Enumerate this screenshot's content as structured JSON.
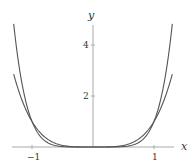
{
  "chart_data": {
    "type": "line",
    "title": "",
    "xlabel": "x",
    "ylabel": "y",
    "xlim": [
      -1.3,
      1.3
    ],
    "ylim": [
      0,
      4.8
    ],
    "x_ticks": [
      -1,
      1
    ],
    "x_tick_labels": [
      "-1",
      "1"
    ],
    "y_ticks": [
      2,
      4
    ],
    "y_tick_labels": [
      "2",
      "4"
    ],
    "grid": false,
    "legend": null,
    "series": [
      {
        "name": "y = x^4",
        "function": "x^4",
        "x": [
          -1.3,
          -1.2,
          -1.1,
          -1.0,
          -0.8,
          -0.6,
          -0.4,
          -0.2,
          0,
          0.2,
          0.4,
          0.6,
          0.8,
          1.0,
          1.1,
          1.2,
          1.3
        ],
        "values": [
          2.86,
          2.07,
          1.46,
          1.0,
          0.41,
          0.13,
          0.03,
          0.0,
          0,
          0.0,
          0.03,
          0.13,
          0.41,
          1.0,
          1.46,
          2.07,
          2.86
        ]
      },
      {
        "name": "y = x^6",
        "function": "x^6",
        "x": [
          -1.3,
          -1.2,
          -1.1,
          -1.0,
          -0.8,
          -0.6,
          -0.4,
          -0.2,
          0,
          0.2,
          0.4,
          0.6,
          0.8,
          1.0,
          1.1,
          1.2,
          1.3
        ],
        "values": [
          4.83,
          2.99,
          1.77,
          1.0,
          0.26,
          0.05,
          0.0,
          0.0,
          0,
          0.0,
          0.0,
          0.05,
          0.26,
          1.0,
          1.77,
          2.99,
          4.83
        ]
      }
    ],
    "colors": {
      "curve": "#555555",
      "axis": "#aaaaaa"
    }
  }
}
